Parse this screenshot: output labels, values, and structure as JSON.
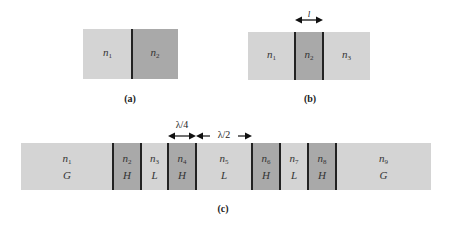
{
  "panels": {
    "a": {
      "caption": "(a)",
      "layers": [
        {
          "label": "n",
          "sub": "1",
          "shade": "light"
        },
        {
          "label": "n",
          "sub": "2",
          "shade": "dark"
        }
      ]
    },
    "b": {
      "caption": "(b)",
      "dimension_label": "l",
      "layers": [
        {
          "label": "n",
          "sub": "1",
          "shade": "light"
        },
        {
          "label": "n",
          "sub": "2",
          "shade": "dark"
        },
        {
          "label": "n",
          "sub": "3",
          "shade": "light"
        }
      ]
    },
    "c": {
      "caption": "(c)",
      "dimension_labels": {
        "quarter_wave": "λ/4",
        "half_wave": "λ/2"
      },
      "layers": [
        {
          "label": "n",
          "sub": "1",
          "type": "G",
          "shade": "light"
        },
        {
          "label": "n",
          "sub": "2",
          "type": "H",
          "shade": "dark"
        },
        {
          "label": "n",
          "sub": "3",
          "type": "L",
          "shade": "light"
        },
        {
          "label": "n",
          "sub": "4",
          "type": "H",
          "shade": "dark"
        },
        {
          "label": "n",
          "sub": "5",
          "type": "L",
          "shade": "light"
        },
        {
          "label": "n",
          "sub": "6",
          "type": "H",
          "shade": "dark"
        },
        {
          "label": "n",
          "sub": "7",
          "type": "L",
          "shade": "light"
        },
        {
          "label": "n",
          "sub": "8",
          "type": "H",
          "shade": "dark"
        },
        {
          "label": "n",
          "sub": "9",
          "type": "G",
          "shade": "light"
        }
      ]
    }
  },
  "colors": {
    "light": "#d4d4d4",
    "dark": "#a9a9a9",
    "line": "#222222"
  }
}
